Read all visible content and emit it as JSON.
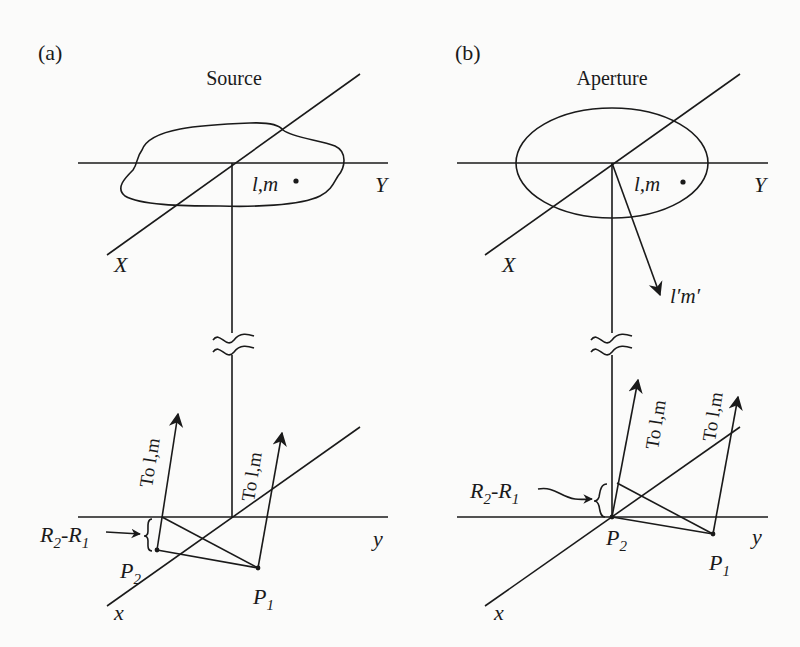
{
  "panels": [
    {
      "id": "a",
      "label": "(a)",
      "title": "Source",
      "upper_axes": {
        "X": "X",
        "Y": "Y"
      },
      "point_label": "l,m",
      "lower_axes": {
        "x": "x",
        "y": "y"
      },
      "arrow_labels": [
        "To l,m",
        "To l,m"
      ],
      "baseline_label": {
        "main": "R",
        "sub1": "2",
        "dash": "-R",
        "sub2": "1"
      },
      "points": {
        "P2": {
          "main": "P",
          "sub": "2"
        },
        "P1": {
          "main": "P",
          "sub": "1"
        }
      }
    },
    {
      "id": "b",
      "label": "(b)",
      "title": "Aperture",
      "upper_axes": {
        "X": "X",
        "Y": "Y"
      },
      "point_label": "l,m",
      "direction_label": "l′m′",
      "lower_axes": {
        "x": "x",
        "y": "y"
      },
      "arrow_labels": [
        "To l,m",
        "To l,m"
      ],
      "baseline_label": {
        "main": "R",
        "sub1": "2",
        "dash": "-R",
        "sub2": "1"
      },
      "points": {
        "P2": {
          "main": "P",
          "sub": "2"
        },
        "P1": {
          "main": "P",
          "sub": "1"
        }
      }
    }
  ]
}
